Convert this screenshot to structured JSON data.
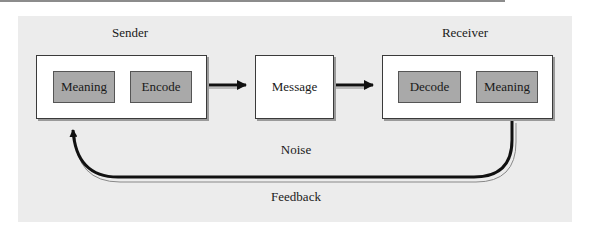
{
  "diagram": {
    "title_labels": {
      "sender": "Sender",
      "receiver": "Receiver",
      "noise": "Noise",
      "feedback": "Feedback"
    },
    "sender_box": {
      "steps": [
        "Meaning",
        "Encode"
      ]
    },
    "message_box": {
      "label": "Message"
    },
    "receiver_box": {
      "steps": [
        "Decode",
        "Meaning"
      ]
    },
    "flow": [
      {
        "from": "Sender",
        "to": "Message"
      },
      {
        "from": "Message",
        "to": "Receiver"
      },
      {
        "from": "Receiver",
        "to": "Sender",
        "label": "Feedback"
      }
    ],
    "colors": {
      "panel": "#ececec",
      "box_fill": "#ffffff",
      "step_fill": "#a9a9a9",
      "arrow": "#111111"
    }
  }
}
